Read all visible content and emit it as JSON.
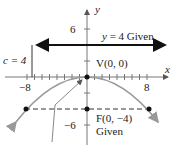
{
  "diagram": {
    "type": "parabola",
    "axes": {
      "x_label": "x",
      "y_label": "y"
    },
    "ticks": {
      "x_neg": "−8",
      "x_pos": "8",
      "y_pos": "6",
      "y_neg": "−6"
    },
    "directrix": {
      "label_var": "y",
      "label_rest": " = 4  Given"
    },
    "c_label": "c = 4",
    "vertex": {
      "label": "V(0, 0)"
    },
    "focus": {
      "label": "F(0, −4)",
      "note": "Given"
    },
    "colors": {
      "curve": "#999999",
      "axis": "#555555",
      "directrix": "#111111",
      "text": "#222222"
    }
  }
}
